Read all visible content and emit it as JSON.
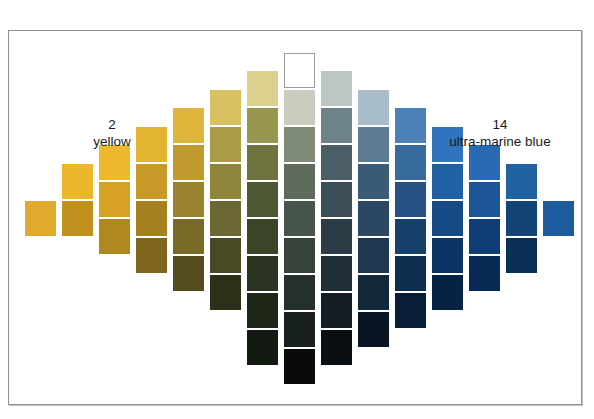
{
  "page": {
    "top_caption": "",
    "background": "#ffffff"
  },
  "plate": {
    "frame_color": "#8e9094",
    "background": "#ffffff"
  },
  "labels": {
    "left": {
      "number": "2",
      "name": "yellow"
    },
    "right": {
      "number": "14",
      "name": "ultra-marine blue"
    }
  },
  "chart_data": {
    "type": "heatmap",
    "title": "",
    "subtitle": "",
    "xlabel": "",
    "ylabel": "",
    "grid": false,
    "legend_position": "none",
    "axis_endpoints": {
      "left": {
        "index": "2",
        "pigment": "yellow"
      },
      "right": {
        "index": "14",
        "pigment": "ultra-marine blue"
      }
    },
    "columns": 13,
    "swatch_size": [
      31,
      35
    ],
    "column_pitch": 37,
    "row_pitch": 37,
    "grid_origin": [
      16,
      22
    ],
    "columns_data": [
      {
        "col": 1,
        "x": 16,
        "top_y": 170,
        "values": [
          "#e0ab2d"
        ]
      },
      {
        "col": 2,
        "x": 53,
        "top_y": 133,
        "values": [
          "#ecb72b",
          "#c1901f"
        ]
      },
      {
        "col": 3,
        "x": 90,
        "top_y": 114,
        "values": [
          "#eeb92c",
          "#d6a124",
          "#b08820"
        ]
      },
      {
        "col": 4,
        "x": 127,
        "top_y": 96,
        "values": [
          "#e3b432",
          "#c79a27",
          "#a5821f",
          "#7e671c"
        ]
      },
      {
        "col": 5,
        "x": 164,
        "top_y": 77,
        "values": [
          "#deb63c",
          "#c0992f",
          "#9c8230",
          "#7a6a28",
          "#564c21"
        ]
      },
      {
        "col": 6,
        "x": 201,
        "top_y": 59,
        "values": [
          "#d9c063",
          "#ab9a46",
          "#8e853c",
          "#6b6733",
          "#484a25",
          "#2d3018"
        ]
      },
      {
        "col": 7,
        "x": 238,
        "top_y": 40,
        "values": [
          "#dcd08f",
          "#97964f",
          "#6f7340",
          "#4e5832",
          "#3a452a",
          "#2b3420",
          "#1e2618",
          "#121a11"
        ]
      },
      {
        "col": 8,
        "x": 275,
        "top_y": 22,
        "values": [
          "#ffffff",
          "#c9cbbf",
          "#7f8b77",
          "#5d6a5c",
          "#47544a",
          "#36423a",
          "#26302b",
          "#18201d",
          "#090b09"
        ]
      },
      {
        "col": 9,
        "x": 312,
        "top_y": 40,
        "values": [
          "#bcc6c5",
          "#6e8289",
          "#4b5e68",
          "#3b4d57",
          "#2d3d47",
          "#202e38",
          "#141d24",
          "#0a0f13"
        ]
      },
      {
        "col": 10,
        "x": 349,
        "top_y": 59,
        "values": [
          "#a8bcc9",
          "#5d7b93",
          "#3a5a75",
          "#2a4862",
          "#1d384f",
          "#12283b",
          "#081522"
        ]
      },
      {
        "col": 11,
        "x": 386,
        "top_y": 77,
        "values": [
          "#4c81b8",
          "#376b9e",
          "#255484",
          "#17406b",
          "#0d2e4f",
          "#071e36"
        ]
      },
      {
        "col": 12,
        "x": 423,
        "top_y": 96,
        "values": [
          "#2f74bd",
          "#2160a4",
          "#154a86",
          "#0c3565",
          "#062344"
        ]
      },
      {
        "col": 13,
        "x": 460,
        "top_y": 114,
        "values": [
          "#2a69b4",
          "#1c5598",
          "#0f3e76",
          "#072a55"
        ]
      },
      {
        "col": 14,
        "x": 497,
        "top_y": 133,
        "values": [
          "#22619f",
          "#124576",
          "#0a3055"
        ]
      },
      {
        "col": 15,
        "x": 534,
        "top_y": 170,
        "values": [
          "#1d5c9d"
        ]
      }
    ]
  }
}
